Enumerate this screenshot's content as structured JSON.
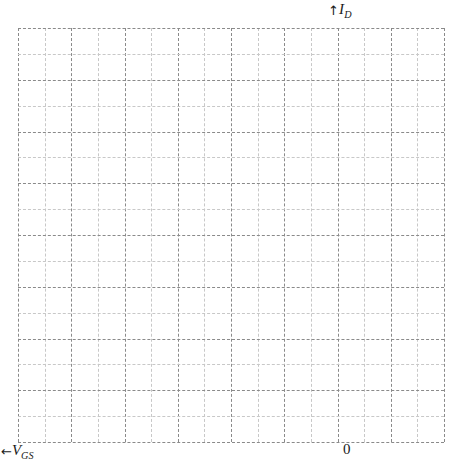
{
  "chart_data": {
    "type": "scatter",
    "title": "",
    "subtitle": "",
    "xlabel": "V_GS",
    "ylabel": "I_D",
    "x_axis_symbol": "V",
    "x_axis_subscript": "GS",
    "x_axis_arrow": "←",
    "y_axis_symbol": "I",
    "y_axis_subscript": "D",
    "y_axis_arrow": "↑",
    "origin_tick_label": "0",
    "x": [],
    "values": [],
    "series": [],
    "xlim": [
      null,
      0
    ],
    "ylim": [
      0,
      null
    ],
    "grid": true,
    "grid_style": "dashed",
    "grid_columns": 16,
    "grid_rows": 16,
    "minor_grid": true,
    "legend": null,
    "legend_position": "none",
    "tick_labels_x": [
      "0"
    ],
    "tick_labels_y": [],
    "annotations": []
  },
  "figure": {
    "background_color": "#ffffff",
    "major_grid_color": "#8a8a8a",
    "minor_grid_color": "#c8c8c8",
    "text_color": "#1a1a1a",
    "width_px": 463,
    "height_px": 461
  },
  "labels": {
    "y_axis_full": "↑I D",
    "x_axis_full": "←V GS",
    "origin": "0"
  }
}
